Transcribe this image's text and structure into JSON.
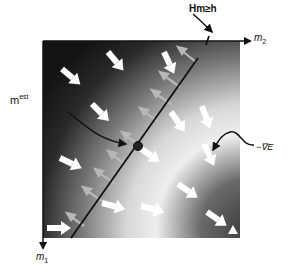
{
  "labels": {
    "constraint": "Hm≥h",
    "axis_m2": "m",
    "axis_m2_sub": "2",
    "axis_m1": "m",
    "axis_m1_sub": "1",
    "estimate": "m",
    "estimate_sup": "est",
    "gradient": "−∇E"
  },
  "colors": {
    "background_dark": "#1a1a1a",
    "background_light": "#f0f0f0",
    "line": "#111111",
    "arrow_white": "#ffffff",
    "arrow_gray": "#b8b8b8"
  },
  "figure": {
    "plot_region": {
      "x": 43,
      "y": 41,
      "width": 197,
      "height": 197
    },
    "constraint_line": {
      "x1": 198,
      "y1": 58,
      "x2": 71,
      "y2": 238
    },
    "estimate_point": {
      "x": 138,
      "y": 146
    },
    "marker": "triangle"
  }
}
